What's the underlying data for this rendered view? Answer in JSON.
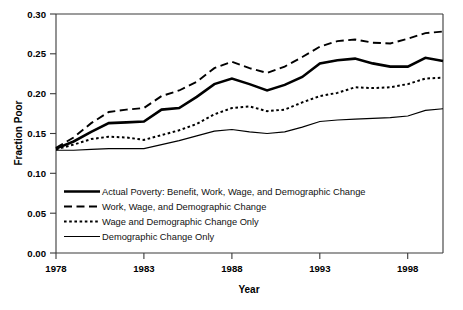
{
  "chart_data": {
    "type": "line",
    "title": "",
    "xlabel": "Year",
    "ylabel": "Fraction Poor",
    "xlim": [
      1978,
      2000
    ],
    "ylim": [
      0.0,
      0.3
    ],
    "grid": false,
    "legend_position": "inside-lower-left",
    "x_ticks": [
      "1978",
      "1983",
      "1988",
      "1993",
      "1998"
    ],
    "x_tick_values": [
      1978,
      1983,
      1988,
      1993,
      1998
    ],
    "y_ticks": [
      "0.00",
      "0.05",
      "0.10",
      "0.15",
      "0.20",
      "0.25",
      "0.30"
    ],
    "y_tick_values": [
      0.0,
      0.05,
      0.1,
      0.15,
      0.2,
      0.25,
      0.3
    ],
    "x": [
      1978,
      1979,
      1980,
      1981,
      1982,
      1983,
      1984,
      1985,
      1986,
      1987,
      1988,
      1989,
      1990,
      1991,
      1992,
      1993,
      1994,
      1995,
      1996,
      1997,
      1998,
      1999,
      2000
    ],
    "series": [
      {
        "name": "Actual Poverty: Benefit, Work, Wage, and Demographic Change",
        "style": "solid-thick",
        "values": [
          0.131,
          0.14,
          0.152,
          0.163,
          0.164,
          0.165,
          0.18,
          0.182,
          0.196,
          0.212,
          0.219,
          0.212,
          0.204,
          0.211,
          0.221,
          0.238,
          0.242,
          0.244,
          0.238,
          0.234,
          0.234,
          0.245,
          0.241
        ]
      },
      {
        "name": "Work, Wage, and Demographic Change",
        "style": "dashed",
        "values": [
          0.132,
          0.145,
          0.163,
          0.177,
          0.18,
          0.182,
          0.197,
          0.204,
          0.215,
          0.232,
          0.24,
          0.232,
          0.226,
          0.234,
          0.246,
          0.259,
          0.266,
          0.268,
          0.264,
          0.263,
          0.269,
          0.276,
          0.278
        ]
      },
      {
        "name": "Wage and Demographic Change Only",
        "style": "dotted",
        "values": [
          0.13,
          0.136,
          0.143,
          0.146,
          0.145,
          0.142,
          0.148,
          0.154,
          0.162,
          0.174,
          0.182,
          0.184,
          0.178,
          0.18,
          0.189,
          0.197,
          0.201,
          0.208,
          0.207,
          0.208,
          0.212,
          0.219,
          0.22
        ]
      },
      {
        "name": "Demographic Change Only",
        "style": "solid-thin",
        "values": [
          0.129,
          0.129,
          0.13,
          0.131,
          0.131,
          0.131,
          0.136,
          0.141,
          0.147,
          0.153,
          0.155,
          0.152,
          0.15,
          0.152,
          0.158,
          0.165,
          0.167,
          0.168,
          0.169,
          0.17,
          0.172,
          0.179,
          0.181
        ]
      }
    ],
    "legend": [
      "Actual Poverty: Benefit, Work, Wage, and Demographic Change",
      "Work, Wage, and Demographic Change",
      "Wage and Demographic Change Only",
      "Demographic Change Only"
    ],
    "colors": {
      "line": "#000000",
      "axis": "#3a3a3a",
      "background": "#ffffff"
    }
  }
}
